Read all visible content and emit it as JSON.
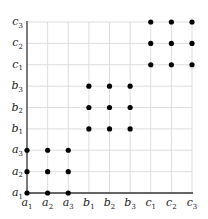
{
  "diagram": {
    "type": "product-grid",
    "x_labels": [
      {
        "base": "a",
        "sub": "1"
      },
      {
        "base": "a",
        "sub": "2"
      },
      {
        "base": "a",
        "sub": "3"
      },
      {
        "base": "b",
        "sub": "1"
      },
      {
        "base": "b",
        "sub": "2"
      },
      {
        "base": "b",
        "sub": "3"
      },
      {
        "base": "c",
        "sub": "1"
      },
      {
        "base": "c",
        "sub": "2"
      },
      {
        "base": "c",
        "sub": "3"
      }
    ],
    "y_labels": [
      {
        "base": "a",
        "sub": "1"
      },
      {
        "base": "a",
        "sub": "2"
      },
      {
        "base": "a",
        "sub": "3"
      },
      {
        "base": "b",
        "sub": "1"
      },
      {
        "base": "b",
        "sub": "2"
      },
      {
        "base": "b",
        "sub": "3"
      },
      {
        "base": "c",
        "sub": "1"
      },
      {
        "base": "c",
        "sub": "2"
      },
      {
        "base": "c",
        "sub": "3"
      }
    ],
    "points": [
      [
        0,
        0
      ],
      [
        1,
        0
      ],
      [
        2,
        0
      ],
      [
        0,
        1
      ],
      [
        1,
        1
      ],
      [
        2,
        1
      ],
      [
        0,
        2
      ],
      [
        1,
        2
      ],
      [
        2,
        2
      ],
      [
        3,
        3
      ],
      [
        4,
        3
      ],
      [
        5,
        3
      ],
      [
        3,
        4
      ],
      [
        4,
        4
      ],
      [
        5,
        4
      ],
      [
        3,
        5
      ],
      [
        4,
        5
      ],
      [
        5,
        5
      ],
      [
        6,
        6
      ],
      [
        7,
        6
      ],
      [
        8,
        6
      ],
      [
        6,
        7
      ],
      [
        7,
        7
      ],
      [
        8,
        7
      ],
      [
        6,
        8
      ],
      [
        7,
        8
      ],
      [
        8,
        8
      ]
    ],
    "colors": {
      "grid": "#dddddd",
      "axis": "#333333",
      "point": "#000000"
    }
  }
}
